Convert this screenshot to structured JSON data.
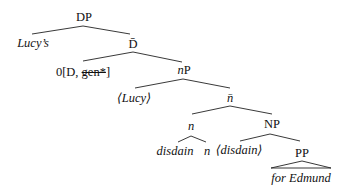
{
  "diagram": {
    "type": "syntax-tree",
    "nodes": {
      "dp": {
        "label": "DP"
      },
      "lucys": {
        "label": "Lucy’s"
      },
      "dbar": {
        "label": "D̄"
      },
      "zero_head": {
        "prefix": "0[D, ",
        "strike": "gen*",
        "suffix": "]"
      },
      "np_little": {
        "italic": "n",
        "rest": "P"
      },
      "lucy_trace": {
        "label": "⟨Lucy⟩"
      },
      "nbar": {
        "label": "n̄"
      },
      "n_head": {
        "label": "n"
      },
      "NP": {
        "label": "NP"
      },
      "disdain": {
        "label": "disdain"
      },
      "n_leaf": {
        "label": "n"
      },
      "disdain_trace": {
        "label": "⟨disdain⟩"
      },
      "PP": {
        "label": "PP"
      },
      "for_edmund": {
        "label": "for Edmund"
      }
    },
    "edges": [
      [
        "DP",
        "Lucy's"
      ],
      [
        "DP",
        "D-bar"
      ],
      [
        "D-bar",
        "0[D, gen*]"
      ],
      [
        "D-bar",
        "nP"
      ],
      [
        "nP",
        "<Lucy>"
      ],
      [
        "nP",
        "n-bar"
      ],
      [
        "n-bar",
        "n"
      ],
      [
        "n-bar",
        "NP"
      ],
      [
        "n",
        "disdain"
      ],
      [
        "n",
        "n"
      ],
      [
        "NP",
        "<disdain>"
      ],
      [
        "NP",
        "PP"
      ],
      [
        "PP",
        "for Edmund (triangle)"
      ]
    ]
  }
}
